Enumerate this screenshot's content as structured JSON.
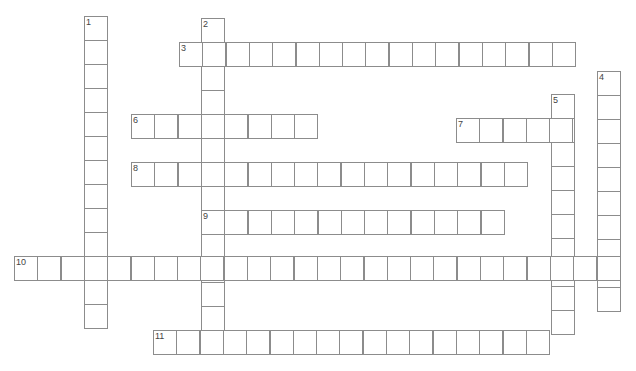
{
  "puzzle": {
    "cell_w": 23.3,
    "cell_h": 24,
    "words": [
      {
        "number": "1",
        "direction": "down",
        "x": 84,
        "y": 16,
        "length": 13
      },
      {
        "number": "2",
        "direction": "down",
        "x": 201,
        "y": 18,
        "length": 14
      },
      {
        "number": "3",
        "direction": "across",
        "x": 179,
        "y": 42,
        "length": 17
      },
      {
        "number": "4",
        "direction": "down",
        "x": 597,
        "y": 71,
        "length": 10
      },
      {
        "number": "5",
        "direction": "down",
        "x": 551,
        "y": 94,
        "length": 10
      },
      {
        "number": "6",
        "direction": "across",
        "x": 131,
        "y": 114,
        "length": 8
      },
      {
        "number": "7",
        "direction": "across",
        "x": 456,
        "y": 118,
        "length": 5
      },
      {
        "number": "8",
        "direction": "across",
        "x": 131,
        "y": 162,
        "length": 17
      },
      {
        "number": "9",
        "direction": "across",
        "x": 201,
        "y": 210,
        "length": 13
      },
      {
        "number": "10",
        "direction": "across",
        "x": 14,
        "y": 256,
        "length": 26
      },
      {
        "number": "11",
        "direction": "across",
        "x": 153,
        "y": 330,
        "length": 17
      }
    ]
  }
}
